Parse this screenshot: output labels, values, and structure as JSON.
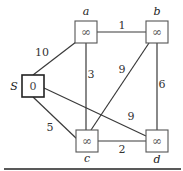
{
  "graph": {
    "nodes": [
      {
        "id": "S",
        "label": "S",
        "value": "0",
        "source": true
      },
      {
        "id": "a",
        "label": "a",
        "value": "∞"
      },
      {
        "id": "b",
        "label": "b",
        "value": "∞"
      },
      {
        "id": "c",
        "label": "c",
        "value": "∞"
      },
      {
        "id": "d",
        "label": "d",
        "value": "∞"
      }
    ],
    "edges": [
      {
        "from": "S",
        "to": "a",
        "weight": "10"
      },
      {
        "from": "S",
        "to": "c",
        "weight": "5"
      },
      {
        "from": "S",
        "to": "d",
        "weight": "9"
      },
      {
        "from": "a",
        "to": "b",
        "weight": "1"
      },
      {
        "from": "a",
        "to": "c",
        "weight": "3"
      },
      {
        "from": "b",
        "to": "c",
        "weight": "9"
      },
      {
        "from": "b",
        "to": "d",
        "weight": "6"
      },
      {
        "from": "c",
        "to": "d",
        "weight": "2"
      }
    ]
  }
}
